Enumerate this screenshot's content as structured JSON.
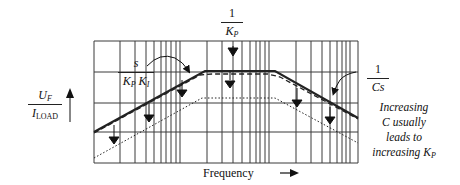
{
  "diagram": {
    "y_axis_label": {
      "numerator": "U",
      "numerator_sub": "F",
      "denominator": "I",
      "denominator_sub": "LOAD"
    },
    "x_axis_label": "Frequency",
    "labels": {
      "rising": {
        "numerator": "s",
        "denominator_K1": "K",
        "sub1": "P",
        "denominator_K2": "K",
        "sub2": "I"
      },
      "flat": {
        "numerator": "1",
        "denominator": "K",
        "sub": "P"
      },
      "falling": {
        "numerator": "1",
        "denominator": "Cs"
      }
    },
    "note": {
      "line1": "Increasing",
      "line2": "C usually",
      "line3": "leads to",
      "line4_prefix": "increasing K",
      "line4_sub": "P"
    },
    "grid": {
      "left": 94,
      "right": 358,
      "top": 41,
      "bottom": 163,
      "horizontal_lines": [
        41,
        72,
        103,
        132,
        163
      ],
      "vertical_lines": [
        94,
        120,
        135,
        146,
        154,
        161,
        166,
        171,
        176,
        180,
        207,
        222,
        233,
        242,
        250,
        256,
        260,
        265,
        269,
        296,
        311,
        322,
        330,
        337,
        342,
        346,
        350,
        358
      ]
    },
    "curves": {
      "solid": [
        [
          94,
          132
        ],
        [
          205,
          71
        ],
        [
          275,
          71
        ],
        [
          358,
          118
        ]
      ],
      "dashed": [
        [
          94,
          133
        ],
        [
          200,
          75
        ],
        [
          212,
          74
        ],
        [
          268,
          74
        ],
        [
          280,
          77
        ],
        [
          358,
          119
        ]
      ],
      "dotted": [
        [
          94,
          158
        ],
        [
          202,
          98
        ],
        [
          275,
          98
        ],
        [
          358,
          143
        ]
      ]
    },
    "colors": {
      "line": "#222222",
      "grid": "#333333",
      "background": "#ffffff"
    }
  }
}
